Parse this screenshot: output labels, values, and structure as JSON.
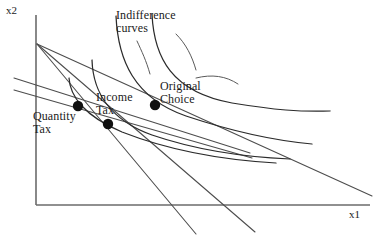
{
  "figure": {
    "type": "economics-indifference-curve-diagram",
    "width": 388,
    "height": 245,
    "background_color": "#ffffff"
  },
  "axes": {
    "y_label": "x2",
    "x_label": "x1",
    "origin": {
      "x": 36,
      "y": 205
    },
    "y_axis_top": {
      "x": 36,
      "y": 15
    },
    "x_axis_right": {
      "x": 370,
      "y": 205
    },
    "axis_color": "#6b6b6b",
    "ticks": [],
    "gridlines": false
  },
  "labels": {
    "indifference_curves": "Indifference\ncurves",
    "original_choice": "Original\nChoice",
    "income_tax": "Income\nTax",
    "quantity_tax": "Quantity\nTax"
  },
  "choice_points": [
    {
      "name": "original-choice",
      "label": "Original Choice",
      "x": 155,
      "y": 105,
      "radius": 5.2,
      "color": "#101010"
    },
    {
      "name": "income-tax-choice",
      "label": "Income Tax",
      "x": 108,
      "y": 124,
      "radius": 5.2,
      "color": "#101010"
    },
    {
      "name": "quantity-tax-choice",
      "label": "Quantity Tax",
      "x": 78,
      "y": 106,
      "radius": 5.2,
      "color": "#101010"
    }
  ],
  "budget_lines": [
    {
      "name": "original-budget-line",
      "description": "Original budget constraint, flattest slope from y-intercept to far x-axis",
      "path": "M 37 44 L 372 196",
      "color": "#4d4d4d"
    },
    {
      "name": "quantity-tax-budget-line",
      "description": "Quantity tax budget line, steepest, pivots from same vertical intercept",
      "path": "M 37 44 L 196 234",
      "color": "#4d4d4d"
    },
    {
      "name": "quantity-tax-budget-line-inner",
      "description": "Second pivoted line from vertical intercept through quantity tax point",
      "path": "M 37 44 L 255 232",
      "color": "#4d4d4d"
    },
    {
      "name": "income-tax-budget-line",
      "description": "Income tax budget line, parallel shift inward, upper of the pair",
      "path": "M 14 78 L 250 153",
      "color": "#4d4d4d"
    },
    {
      "name": "income-tax-budget-line-lower",
      "description": "Lower parallel budget line segment",
      "path": "M 14 90 L 252 158",
      "color": "#4d4d4d"
    }
  ],
  "indifference_curves": [
    {
      "name": "indifference-curve-highest",
      "description": "Highest indifference curve tangent to original budget line at Original Choice",
      "path": "M 152 14 C 154 58, 172 92, 232 103 C 275 110, 300 112, 330 111",
      "color": "#2b2b2b"
    },
    {
      "name": "indifference-curve-original",
      "description": "Curve through the Original Choice point",
      "path": "M 116 16 C 118 60, 134 98, 186 116 C 228 130, 268 140, 312 144",
      "color": "#2b2b2b"
    },
    {
      "name": "indifference-curve-income-tax",
      "description": "Curve through the Income Tax point, lower utility",
      "path": "M 92 60 C 93 92, 110 120, 152 135 C 196 150, 244 157, 290 159",
      "color": "#2b2b2b"
    },
    {
      "name": "indifference-curve-quantity-tax",
      "description": "Lowest curve through the Quantity Tax point",
      "path": "M 69 78 C 70 96, 84 116, 122 132 C 168 150, 224 160, 276 163",
      "color": "#2b2b2b"
    }
  ],
  "leader_lines": [
    {
      "name": "leader-indifference-to-curve-left",
      "path": "M 137 41 C 142 52, 146 60, 150 74",
      "color": "#5a5a5a"
    },
    {
      "name": "leader-indifference-to-curve-right",
      "path": "M 176 34 C 186 44, 192 56, 196 70",
      "color": "#5a5a5a"
    },
    {
      "name": "leader-original-choice-to-point",
      "path": "M 196 78 C 212 74, 226 76, 238 84",
      "color": "#5a5a5a"
    }
  ],
  "colors": {
    "axis": "#6b6b6b",
    "budget_line": "#4d4d4d",
    "indifference_curve": "#2b2b2b",
    "point": "#101010",
    "text": "#1a1a1a",
    "background": "#ffffff"
  }
}
